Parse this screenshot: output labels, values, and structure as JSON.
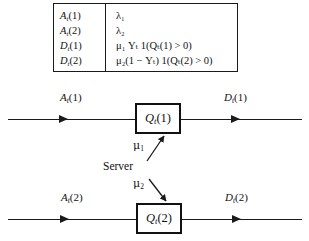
{
  "figure": {
    "background_color": "#ffffff",
    "ink_color": "#1a1a1a"
  },
  "definition_table": {
    "rows": [
      {
        "symbol_base": "A",
        "symbol_sub": "t",
        "symbol_arg": "(1)",
        "definition_html": "λ₁"
      },
      {
        "symbol_base": "A",
        "symbol_sub": "t",
        "symbol_arg": "(2)",
        "definition_html": "λ₂"
      },
      {
        "symbol_base": "D",
        "symbol_sub": "t",
        "symbol_arg": "(1)",
        "definition_html": "μ₁ Yₜ 1(Qₜ(1) > 0)"
      },
      {
        "symbol_base": "D",
        "symbol_sub": "t",
        "symbol_arg": "(2)",
        "definition_html": "μ₂(1 − Yₜ) 1(Qₜ(2) > 0)"
      }
    ]
  },
  "queues": [
    {
      "id": "queue-1",
      "arrival_label": {
        "base": "A",
        "sub": "t",
        "arg": "(1)"
      },
      "box_label": {
        "base": "Q",
        "sub": "t",
        "arg": "(1)"
      },
      "departure_label": {
        "base": "D",
        "sub": "t",
        "arg": "(1)"
      }
    },
    {
      "id": "queue-2",
      "arrival_label": {
        "base": "A",
        "sub": "t",
        "arg": "(2)"
      },
      "box_label": {
        "base": "Q",
        "sub": "t",
        "arg": "(2)"
      },
      "departure_label": {
        "base": "D",
        "sub": "t",
        "arg": "(2)"
      }
    }
  ],
  "server": {
    "label": "Server",
    "rate_to_queue1": {
      "symbol": "μ",
      "sub": "1"
    },
    "rate_to_queue2": {
      "symbol": "μ",
      "sub": "2"
    }
  }
}
